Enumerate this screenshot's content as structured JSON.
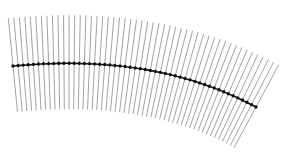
{
  "diagram": {
    "type": "curve-with-normal-lines",
    "width": 282,
    "height": 162,
    "background": "#ffffff",
    "curve": {
      "color": "#111111",
      "stroke_width": 1.6,
      "dot_radius": 1.7,
      "control_points": [
        [
          13,
          66
        ],
        [
          95,
          58
        ],
        [
          180,
          66
        ],
        [
          256,
          107
        ]
      ]
    },
    "normals": {
      "count": 50,
      "color": "#8a8a8a",
      "stroke_width": 0.8,
      "length_above": 48,
      "length_below": 46
    }
  }
}
